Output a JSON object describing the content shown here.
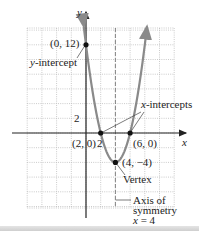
{
  "chart_data": {
    "type": "line",
    "title": "",
    "function": "y = x^2 - 8x + 12 = (x - 2)(x - 6)",
    "xlabel": "x",
    "ylabel": "y",
    "xlim": [
      -8,
      12
    ],
    "ylim": [
      -10,
      14
    ],
    "grid": true,
    "grid_step": 2,
    "tick_labels": {
      "x": [
        "2"
      ],
      "y": [
        "2"
      ]
    },
    "series": [
      {
        "name": "parabola",
        "x": [
          -0.3,
          0,
          1,
          2,
          3,
          4,
          5,
          6,
          7,
          8,
          8.3
        ],
        "y": [
          14.5,
          12,
          5,
          0,
          -3,
          -4,
          -3,
          0,
          5,
          12,
          14.5
        ]
      }
    ],
    "points": [
      {
        "label": "(0, 12)",
        "x": 0,
        "y": 12,
        "annotation": "y-intercept"
      },
      {
        "label": "(2, 0)",
        "x": 2,
        "y": 0,
        "annotation": "x-intercepts"
      },
      {
        "label": "(6, 0)",
        "x": 6,
        "y": 0,
        "annotation": "x-intercepts"
      },
      {
        "label": "(4, −4)",
        "x": 4,
        "y": -4,
        "annotation": "Vertex"
      }
    ],
    "axis_of_symmetry": {
      "x": 4,
      "style": "dashed"
    },
    "annotations": [
      "y-intercept",
      "x-intercepts",
      "Vertex",
      "Axis of symmetry x = 4"
    ]
  },
  "labels": {
    "y_axis": "y",
    "x_axis": "x",
    "y_tick_2": "2",
    "x_tick_2": "2",
    "pt_y_intercept": "(0, 12)",
    "y_intercept_text_var": "y",
    "y_intercept_text": "-intercept",
    "x_intercepts_var": "x",
    "x_intercepts_text": "-intercepts",
    "pt_2_0": "(2, 0)",
    "pt_6_0": "(6, 0)",
    "pt_vertex": "(4, −4)",
    "vertex_text": "Vertex",
    "axis_line1": "Axis of",
    "axis_line2": "symmetry",
    "axis_line3_var": "x",
    "axis_line3_rest": " = 4"
  },
  "colors": {
    "curve": "#8a8a8a",
    "axes": "#222222",
    "grid": "#b5b5b5",
    "points": "#111111",
    "background": "#ffffff"
  }
}
